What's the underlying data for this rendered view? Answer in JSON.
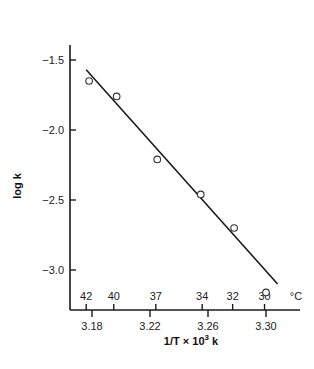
{
  "chart_data": {
    "type": "scatter",
    "title": "",
    "xlabel": "1/T × 10³ k",
    "xlabel_parts": {
      "base": "1/T  ×  10",
      "sup": "3",
      "tail": " k"
    },
    "ylabel": "log k",
    "xlim": [
      3.16,
      3.32
    ],
    "ylim": [
      -3.3,
      -1.4
    ],
    "grid": false,
    "legend": null,
    "x_ticks": [
      3.18,
      3.22,
      3.26,
      3.3
    ],
    "x_tick_labels": [
      "3.18",
      "3.22",
      "3.26",
      "3.30"
    ],
    "y_ticks": [
      -1.5,
      -2.0,
      -2.5,
      -3.0
    ],
    "y_tick_labels": [
      "-1.5",
      "-2.0",
      "-2.5",
      "-3.0"
    ],
    "secondary_x_axis": {
      "unit_label": "°C",
      "ticks": [
        {
          "label": "42",
          "x": 3.176
        },
        {
          "label": "40",
          "x": 3.195
        },
        {
          "label": "37",
          "x": 3.224
        },
        {
          "label": "34",
          "x": 3.256
        },
        {
          "label": "32",
          "x": 3.277
        },
        {
          "label": "30",
          "x": 3.299
        }
      ]
    },
    "series": [
      {
        "name": "observed",
        "marker": "open-circle",
        "x": [
          3.178,
          3.197,
          3.225,
          3.255,
          3.278,
          3.3
        ],
        "y": [
          -1.65,
          -1.76,
          -2.21,
          -2.46,
          -2.7,
          -3.16
        ]
      },
      {
        "name": "fit",
        "style": "line",
        "x": [
          3.176,
          3.308
        ],
        "y": [
          -1.57,
          -3.1
        ]
      }
    ]
  }
}
